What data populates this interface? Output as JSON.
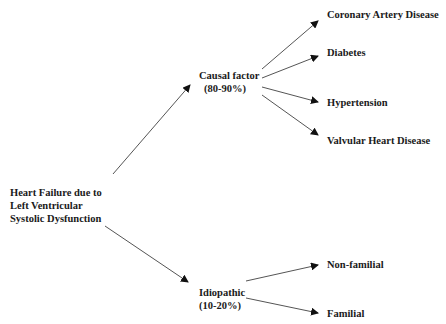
{
  "diagram": {
    "root": {
      "lines": [
        "Heart Failure due to",
        "Left Ventricular",
        "Systolic Dysfunction"
      ]
    },
    "branches": [
      {
        "id": "causal",
        "lines": [
          "Causal factor",
          "(80-90%)"
        ],
        "children": [
          "Coronary Artery Disease",
          "Diabetes",
          "Hypertension",
          "Valvular Heart Disease"
        ]
      },
      {
        "id": "idiopathic",
        "lines": [
          "Idiopathic",
          "(10-20%)"
        ],
        "children": [
          "Non-familial",
          "Familial"
        ]
      }
    ],
    "colors": {
      "text": "#1a1a1a",
      "arrow": "#555555",
      "background": "#ffffff"
    }
  }
}
